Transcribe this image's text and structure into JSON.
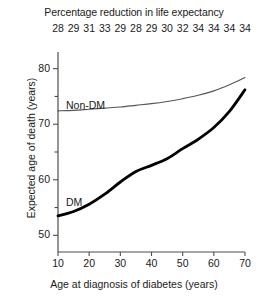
{
  "chart_data": {
    "type": "line",
    "title": "Percentage reduction in life expectancy",
    "xlabel": "Age at diagnosis of diabetes (years)",
    "ylabel": "Expected age of death (years)",
    "xlim": [
      10,
      70
    ],
    "ylim": [
      47,
      83
    ],
    "grid": false,
    "legend_position": "inline-annotations",
    "x_ticks": [
      10,
      20,
      30,
      40,
      50,
      60,
      70
    ],
    "y_ticks": [
      50,
      60,
      70,
      80
    ],
    "y_minor_ticks": [
      55,
      65,
      75
    ],
    "secondary_axis": {
      "label": "Percentage reduction in life expectancy",
      "position": "top",
      "x": [
        10,
        15,
        20,
        25,
        30,
        35,
        40,
        45,
        50,
        55,
        60,
        65,
        70
      ],
      "values": [
        28,
        29,
        31,
        33,
        29,
        28,
        29,
        30,
        32,
        34,
        34,
        34,
        34
      ]
    },
    "x": [
      10,
      15,
      20,
      25,
      30,
      35,
      40,
      45,
      50,
      55,
      60,
      65,
      70
    ],
    "series": [
      {
        "name": "Non-DM",
        "label": "Non-DM",
        "style": "thin",
        "color": "#555555",
        "values": [
          72.4,
          72.5,
          72.7,
          72.9,
          73.1,
          73.4,
          73.7,
          74.1,
          74.6,
          75.2,
          76.0,
          77.1,
          78.4
        ]
      },
      {
        "name": "DM",
        "label": "DM",
        "style": "thick",
        "color": "#000000",
        "values": [
          53.5,
          54.3,
          55.6,
          57.4,
          59.6,
          61.5,
          62.6,
          63.8,
          65.6,
          67.3,
          69.4,
          72.3,
          76.2
        ]
      }
    ]
  },
  "annotations": {
    "non_dm_label": "Non-DM",
    "dm_label": "DM"
  }
}
